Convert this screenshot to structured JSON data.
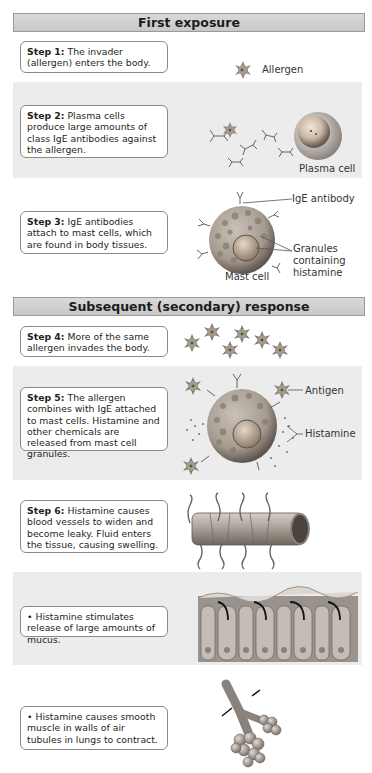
{
  "sections": {
    "first": {
      "title": "First exposure"
    },
    "secondary": {
      "title": "Subsequent (secondary) response"
    }
  },
  "steps": {
    "s1": {
      "label": "Step 1:",
      "text": " The invader (allergen) enters the body."
    },
    "s2": {
      "label": "Step 2:",
      "text": " Plasma cells produce large amounts of class IgE antibodies against the allergen."
    },
    "s3": {
      "label": "Step 3:",
      "text": " IgE antibodies attach to mast cells, which are found in body tissues."
    },
    "s4": {
      "label": "Step 4:",
      "text": " More of the same allergen invades the body."
    },
    "s5": {
      "label": "Step 5:",
      "text": " The allergen combines with IgE attached to mast cells. Histamine and other chemicals are released from mast cell granules."
    },
    "s6": {
      "label": "Step 6:",
      "text": " Histamine causes blood vessels to widen and become leaky. Fluid enters the tissue, causing swelling."
    },
    "b1": {
      "text": "• Histamine stimulates release of large amounts of mucus."
    },
    "b2": {
      "text": "• Histamine causes smooth muscle in walls of air tubules in lungs to contract."
    }
  },
  "labels": {
    "allergen": "Allergen",
    "plasma_cell": "Plasma cell",
    "ige_antibody": "IgE antibody",
    "granules_1": "Granules",
    "granules_2": "containing",
    "granules_3": "histamine",
    "mast_cell": "Mast cell",
    "antigen": "Antigen",
    "histamine": "Histamine"
  },
  "colors": {
    "header_bg": "#cfcfcf",
    "band_bg": "#ececec",
    "box_border": "#8a8a8a"
  }
}
